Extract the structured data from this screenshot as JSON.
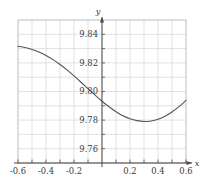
{
  "chart_data": {
    "type": "line",
    "title": "",
    "subtitle": "",
    "xlabel": "x",
    "ylabel": "y",
    "xlim": [
      -0.6,
      0.6
    ],
    "ylim": [
      9.7505,
      9.8505
    ],
    "grid": true,
    "grid_x_step": 0.1,
    "grid_y_step": 0.01,
    "legend": "none",
    "xticks": [
      -0.6,
      -0.4,
      -0.2,
      0.2,
      0.4,
      0.6
    ],
    "xtick_labels": [
      "-0.6",
      "-0.4",
      "-0.2",
      "0.2",
      "0.4",
      "0.6"
    ],
    "yticks": [
      9.76,
      9.78,
      9.8,
      9.82,
      9.84
    ],
    "ytick_labels": [
      "9.76",
      "9.78",
      "9.80",
      "9.82",
      "9.84"
    ],
    "x": [
      -0.6,
      -0.55,
      -0.5,
      -0.45,
      -0.4,
      -0.35,
      -0.3,
      -0.25,
      -0.2,
      -0.15,
      -0.1,
      -0.05,
      0.0,
      0.05,
      0.1,
      0.15,
      0.2,
      0.25,
      0.3,
      0.35,
      0.4,
      0.45,
      0.5,
      0.55,
      0.6
    ],
    "y": [
      9.8321,
      9.8313,
      9.8299,
      9.8281,
      9.8257,
      9.8228,
      9.8194,
      9.8156,
      9.8114,
      9.807,
      9.8025,
      9.798,
      9.7937,
      9.7898,
      9.7864,
      9.7835,
      9.7814,
      9.7801,
      9.7795,
      9.7799,
      9.7811,
      9.7832,
      9.7862,
      9.7899,
      9.7943
    ],
    "series": [
      {
        "name": "curve",
        "color": "#555555",
        "values": [
          9.8321,
          9.8313,
          9.8299,
          9.8281,
          9.8257,
          9.8228,
          9.8194,
          9.8156,
          9.8114,
          9.807,
          9.8025,
          9.798,
          9.7937,
          9.7898,
          9.7864,
          9.7835,
          9.7814,
          9.7801,
          9.7795,
          9.7799,
          9.7811,
          9.7832,
          9.7862,
          9.7899,
          9.7943
        ]
      }
    ],
    "annotations": [],
    "minimum": {
      "x": 0.0,
      "y": 9.7795
    },
    "colors": {
      "curve": "#555555",
      "grid": "#cfcfcf",
      "axis": "#4a4a4a",
      "frame": "#bcbcbc",
      "text": "#3a3a3a",
      "background": "#ffffff"
    }
  }
}
